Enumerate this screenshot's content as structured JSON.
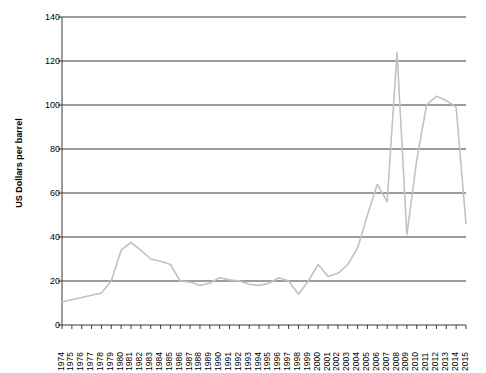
{
  "chart_data": {
    "type": "line",
    "title": "",
    "xlabel": "",
    "ylabel": "US Dollars per barrel",
    "ylim": [
      0,
      140
    ],
    "yticks": [
      0,
      20,
      40,
      60,
      80,
      100,
      120,
      140
    ],
    "grid": true,
    "legend": false,
    "line_color": "#c2c2c2",
    "axis_color": "#3a3a3a",
    "categories": [
      "1974",
      "1975",
      "1976",
      "1977",
      "1978",
      "1979",
      "1980",
      "1981",
      "1982",
      "1983",
      "1984",
      "1985",
      "1986",
      "1987",
      "1988",
      "1989",
      "1990",
      "1991",
      "1992",
      "1993",
      "1994",
      "1995",
      "1996",
      "1997",
      "1998",
      "1999",
      "2000",
      "2001",
      "2002",
      "2003",
      "2004",
      "2005",
      "2006",
      "2007",
      "2008",
      "2009",
      "2010",
      "2011",
      "2012",
      "2013",
      "2014",
      "2015"
    ],
    "values": [
      10.5,
      11.5,
      12.5,
      13.5,
      14.5,
      20.0,
      34.0,
      37.5,
      34.0,
      30.0,
      29.0,
      27.5,
      20.0,
      19.5,
      18.0,
      19.0,
      21.5,
      20.5,
      20.0,
      18.5,
      18.0,
      19.0,
      21.5,
      20.0,
      14.0,
      20.0,
      27.5,
      22.0,
      23.5,
      27.5,
      35.0,
      50.0,
      64.0,
      56.0,
      124.0,
      41.0,
      75.0,
      100.0,
      104.0,
      102.0,
      99.0,
      46.0
    ],
    "series_name": "Crude oil price"
  },
  "axis": {
    "y_title": "US Dollars per barrel"
  }
}
